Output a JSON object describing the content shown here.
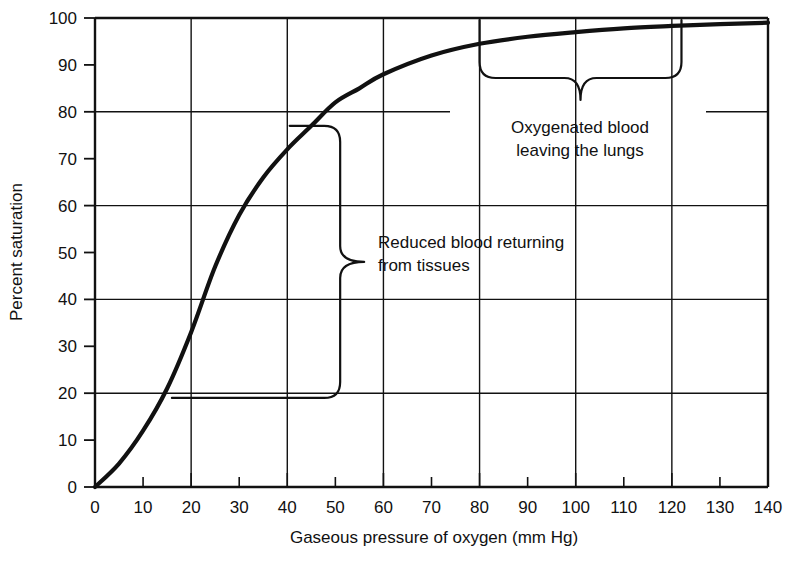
{
  "chart_data": {
    "type": "line",
    "title": "",
    "subtitle": "",
    "xlabel": "Gaseous pressure of oxygen (mm Hg)",
    "ylabel": "Percent saturation",
    "xlim": [
      0,
      140
    ],
    "ylim": [
      0,
      100
    ],
    "grid": true,
    "grid_x_interval": 20,
    "grid_y_interval": 20,
    "tick_x_interval": 10,
    "tick_y_interval": 10,
    "legend": "none",
    "x_ticks": [
      0,
      10,
      20,
      30,
      40,
      50,
      60,
      70,
      80,
      90,
      100,
      110,
      120,
      130,
      140
    ],
    "y_ticks": [
      0,
      10,
      20,
      30,
      40,
      50,
      60,
      70,
      80,
      90,
      100
    ],
    "x_tick_labels": [
      "0",
      "10",
      "20",
      "30",
      "40",
      "50",
      "60",
      "70",
      "80",
      "90",
      "100",
      "110",
      "120",
      "130",
      "140"
    ],
    "y_tick_labels": [
      "0",
      "10",
      "20",
      "30",
      "40",
      "50",
      "60",
      "70",
      "80",
      "90",
      "100"
    ],
    "series": [
      {
        "name": "Oxyhemoglobin dissociation curve",
        "x": [
          0,
          5,
          10,
          15,
          20,
          25,
          30,
          35,
          40,
          45,
          50,
          55,
          60,
          70,
          80,
          90,
          100,
          110,
          120,
          130,
          140
        ],
        "y": [
          0,
          5,
          12,
          21,
          33,
          47,
          58,
          66,
          72,
          77,
          82,
          85,
          88,
          92,
          94.5,
          96,
          97,
          97.8,
          98.3,
          98.7,
          99
        ]
      }
    ],
    "annotations": [
      {
        "name": "oxygenated-blood-annotation",
        "text_line1": "Oxygenated blood",
        "text_line2": "leaving the lungs",
        "brace_orientation": "horizontal-down",
        "brace_x_start": 80,
        "brace_x_end": 122,
        "brace_y": 95
      },
      {
        "name": "reduced-blood-annotation",
        "text_line1": "Reduced blood returning",
        "text_line2": "from tissues",
        "brace_orientation": "vertical-right",
        "brace_y_start": 19,
        "brace_y_end": 77,
        "brace_x": 51
      }
    ],
    "colors": {
      "curve": "#111111",
      "grid": "#111111",
      "axis": "#111111",
      "background": "#ffffff",
      "text": "#111111"
    }
  },
  "axes": {
    "x_title": "Gaseous pressure of oxygen (mm Hg)",
    "y_title": "Percent saturation"
  },
  "annotations": {
    "upper": {
      "line1": "Oxygenated blood",
      "line2": "leaving the lungs"
    },
    "lower": {
      "line1": "Reduced blood returning",
      "line2": "from tissues"
    }
  },
  "x_labels": [
    "0",
    "10",
    "20",
    "30",
    "40",
    "50",
    "60",
    "70",
    "80",
    "90",
    "100",
    "110",
    "120",
    "130",
    "140"
  ],
  "y_labels": [
    "0",
    "10",
    "20",
    "30",
    "40",
    "50",
    "60",
    "70",
    "80",
    "90",
    "100"
  ]
}
